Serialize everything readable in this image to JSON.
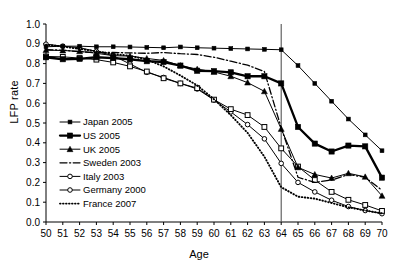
{
  "chart_data": {
    "type": "line",
    "title": "",
    "xlabel": "Age",
    "ylabel": "LFP rate",
    "xlim": [
      50,
      70
    ],
    "ylim": [
      0.0,
      1.0
    ],
    "grid": false,
    "legend_position": "lower-left",
    "x": [
      50,
      51,
      52,
      53,
      54,
      55,
      56,
      57,
      58,
      59,
      60,
      61,
      62,
      63,
      64,
      65,
      66,
      67,
      68,
      69,
      70
    ],
    "yticks": [
      "0.0",
      "0.1",
      "0.2",
      "0.3",
      "0.4",
      "0.5",
      "0.6",
      "0.7",
      "0.8",
      "0.9",
      "1.0"
    ],
    "xticks": [
      "50",
      "51",
      "52",
      "53",
      "54",
      "55",
      "56",
      "57",
      "58",
      "59",
      "60",
      "61",
      "62",
      "63",
      "64",
      "65",
      "66",
      "67",
      "68",
      "69",
      "70"
    ],
    "annotations": [
      {
        "type": "vertical-line",
        "x": 64,
        "label": ""
      }
    ],
    "series": [
      {
        "name": "Japan 2005",
        "marker": "filled-square-small",
        "line": "solid-thin",
        "values": [
          0.885,
          0.888,
          0.888,
          0.885,
          0.885,
          0.884,
          0.882,
          0.88,
          0.884,
          0.88,
          0.878,
          0.876,
          0.874,
          0.872,
          0.87,
          0.79,
          0.7,
          0.61,
          0.52,
          0.44,
          0.36
        ]
      },
      {
        "name": "US 2005",
        "marker": "filled-square",
        "line": "solid-thick",
        "values": [
          0.832,
          0.822,
          0.824,
          0.832,
          0.828,
          0.822,
          0.812,
          0.808,
          0.79,
          0.764,
          0.762,
          0.756,
          0.736,
          0.736,
          0.7,
          0.48,
          0.396,
          0.356,
          0.386,
          0.382,
          0.224
        ]
      },
      {
        "name": "UK 2005",
        "marker": "filled-triangle",
        "line": "solid-thin",
        "values": [
          0.868,
          0.866,
          0.862,
          0.852,
          0.84,
          0.838,
          0.826,
          0.816,
          0.79,
          0.772,
          0.758,
          0.736,
          0.704,
          0.66,
          0.47,
          0.276,
          0.24,
          0.222,
          0.246,
          0.228,
          0.132
        ]
      },
      {
        "name": "Sweden 2003",
        "marker": "none",
        "line": "dash-dot",
        "values": [
          0.87,
          0.868,
          0.86,
          0.856,
          0.856,
          0.854,
          0.852,
          0.856,
          0.85,
          0.846,
          0.832,
          0.812,
          0.792,
          0.76,
          0.476,
          0.226,
          0.2,
          0.212,
          0.24,
          0.226,
          0.16
        ]
      },
      {
        "name": "Italy 2003",
        "marker": "open-circle",
        "line": "solid-thin",
        "values": [
          0.898,
          0.888,
          0.88,
          0.862,
          0.84,
          0.798,
          0.756,
          0.73,
          0.7,
          0.672,
          0.616,
          0.556,
          0.492,
          0.42,
          0.296,
          0.2,
          0.152,
          0.11,
          0.078,
          0.058,
          0.042
        ]
      },
      {
        "name": "Germany 2000",
        "marker": "open-square",
        "line": "solid-thin",
        "values": [
          0.836,
          0.834,
          0.828,
          0.82,
          0.806,
          0.786,
          0.76,
          0.726,
          0.7,
          0.676,
          0.618,
          0.57,
          0.54,
          0.48,
          0.372,
          0.28,
          0.212,
          0.152,
          0.112,
          0.086,
          0.056
        ]
      },
      {
        "name": "France 2007",
        "marker": "none",
        "line": "dotted",
        "values": [
          0.896,
          0.886,
          0.874,
          0.862,
          0.848,
          0.84,
          0.82,
          0.786,
          0.74,
          0.69,
          0.62,
          0.54,
          0.45,
          0.33,
          0.176,
          0.128,
          0.118,
          0.096,
          0.074,
          0.058,
          0.044
        ]
      }
    ]
  },
  "legend": {
    "items": [
      {
        "label": "Japan 2005"
      },
      {
        "label": "US 2005"
      },
      {
        "label": "UK 2005"
      },
      {
        "label": "Sweden 2003"
      },
      {
        "label": "Italy 2003"
      },
      {
        "label": "Germany 2000"
      },
      {
        "label": "France 2007"
      }
    ]
  },
  "axes": {
    "y_title": "LFP rate",
    "x_title": "Age"
  },
  "colors": {
    "line": "#000000",
    "axis": "#000000",
    "background": "#ffffff",
    "annotation_line": "#555555"
  }
}
